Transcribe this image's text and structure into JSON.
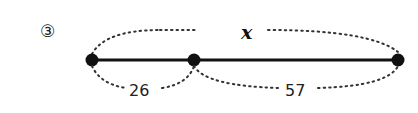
{
  "problem": {
    "number_label": "③"
  },
  "diagram": {
    "total_label": "x",
    "segments": [
      {
        "label": "26"
      },
      {
        "label": "57"
      }
    ],
    "points": 3
  }
}
